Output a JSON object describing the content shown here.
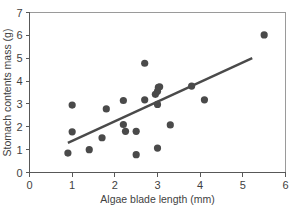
{
  "chart_data": {
    "type": "scatter",
    "title": "",
    "xlabel": "Algae blade length (mm)",
    "ylabel": "Stomach contents mass (g)",
    "xlim": [
      0,
      6
    ],
    "ylim": [
      0,
      7
    ],
    "xticks": [
      0,
      1,
      2,
      3,
      4,
      5,
      6
    ],
    "yticks": [
      0,
      1,
      2,
      3,
      4,
      5,
      6,
      7
    ],
    "xtick_labels": [
      "0",
      "1",
      "2",
      "3",
      "4",
      "5",
      "6"
    ],
    "ytick_labels": [
      "0",
      "1",
      "2",
      "3",
      "4",
      "5",
      "6",
      "7"
    ],
    "grid": false,
    "legend": false,
    "point_color": "#4a4a4a",
    "line_color": "#4a4a4a",
    "axis_color": "#585858",
    "frame_color": "#9a9a9a",
    "background": "#ffffff",
    "points": [
      [
        0.9,
        0.85
      ],
      [
        1.0,
        2.95
      ],
      [
        1.0,
        1.78
      ],
      [
        1.4,
        1.0
      ],
      [
        1.7,
        1.52
      ],
      [
        1.8,
        2.78
      ],
      [
        2.2,
        3.15
      ],
      [
        2.2,
        2.1
      ],
      [
        2.25,
        1.8
      ],
      [
        2.5,
        0.78
      ],
      [
        2.5,
        1.8
      ],
      [
        2.7,
        4.78
      ],
      [
        2.7,
        3.18
      ],
      [
        2.95,
        3.42
      ],
      [
        3.0,
        3.55
      ],
      [
        3.02,
        3.72
      ],
      [
        3.05,
        3.75
      ],
      [
        3.0,
        2.98
      ],
      [
        3.0,
        1.07
      ],
      [
        3.3,
        2.08
      ],
      [
        3.8,
        3.78
      ],
      [
        4.1,
        3.18
      ],
      [
        5.5,
        6.02
      ]
    ],
    "trend_line": {
      "type": "linear-fit",
      "x_start": 0.9,
      "y_start": 1.3,
      "x_end": 5.22,
      "y_end": 5.0
    }
  }
}
